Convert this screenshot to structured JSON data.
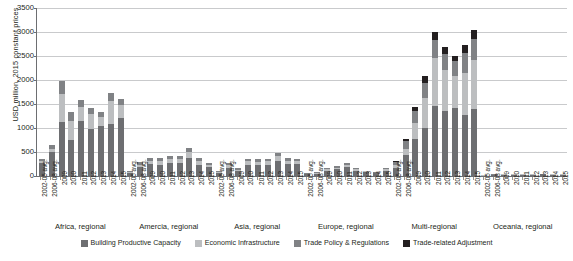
{
  "chart_data": {
    "type": "bar",
    "stacked": true,
    "title": "",
    "xlabel": "",
    "ylabel": "USD million, 2015 constant prices",
    "ylim": [
      0,
      3500
    ],
    "ytick_step": 500,
    "yticks": [
      "0",
      "500",
      "1000",
      "1500",
      "2000",
      "2500",
      "3000",
      "3500"
    ],
    "grid": "horizontal",
    "legend_position": "bottom",
    "categories": [
      "2002-05 avg.",
      "2006-08 avg.",
      "2009",
      "2010",
      "2011",
      "2012",
      "2013",
      "2014",
      "2015"
    ],
    "series": [
      {
        "name": "Building Productive Capacity",
        "color": "#6d6e71"
      },
      {
        "name": "Economic Infrastructure",
        "color": "#bcbec0"
      },
      {
        "name": "Trade Policy & Regulations",
        "color": "#808285"
      },
      {
        "name": "Trade-related Adjustment",
        "color": "#231f20"
      }
    ],
    "groups": [
      {
        "name": "Africa, regional",
        "bars": [
          {
            "category": "2002-05 avg.",
            "values": [
              275,
              40,
              40,
              0
            ],
            "total": 355
          },
          {
            "category": "2006-08 avg.",
            "values": [
              500,
              55,
              85,
              0
            ],
            "total": 640
          },
          {
            "category": "2009",
            "values": [
              1130,
              570,
              290,
              0
            ],
            "total": 1990
          },
          {
            "category": "2010",
            "values": [
              750,
              400,
              175,
              0
            ],
            "total": 1325
          },
          {
            "category": "2011",
            "values": [
              1140,
              295,
              155,
              0
            ],
            "total": 1590
          },
          {
            "category": "2012",
            "values": [
              980,
              305,
              140,
              0
            ],
            "total": 1425
          },
          {
            "category": "2013",
            "values": [
              1035,
              190,
              115,
              0
            ],
            "total": 1340
          },
          {
            "category": "2014",
            "values": [
              1085,
              470,
              175,
              0
            ],
            "total": 1730
          },
          {
            "category": "2015",
            "values": [
              1200,
              290,
              125,
              0
            ],
            "total": 1615
          }
        ]
      },
      {
        "name": "Amercia, regional",
        "bars": [
          {
            "category": "2002-05 avg.",
            "values": [
              60,
              15,
              25,
              0
            ],
            "total": 100
          },
          {
            "category": "2006-08 avg.",
            "values": [
              195,
              40,
              50,
              0
            ],
            "total": 285
          },
          {
            "category": "2009",
            "values": [
              250,
              60,
              70,
              0
            ],
            "total": 380
          },
          {
            "category": "2010",
            "values": [
              235,
              75,
              70,
              0
            ],
            "total": 380
          },
          {
            "category": "2011",
            "values": [
              270,
              75,
              70,
              0
            ],
            "total": 415
          },
          {
            "category": "2012",
            "values": [
              275,
              80,
              65,
              0
            ],
            "total": 420
          },
          {
            "category": "2013",
            "values": [
              380,
              120,
              85,
              0
            ],
            "total": 585
          },
          {
            "category": "2014",
            "values": [
              240,
              70,
              60,
              0
            ],
            "total": 370
          },
          {
            "category": "2015",
            "values": [
              180,
              50,
              45,
              0
            ],
            "total": 275
          }
        ]
      },
      {
        "name": "Asia, regional",
        "bars": [
          {
            "category": "2002-05 avg.",
            "values": [
              65,
              15,
              20,
              0
            ],
            "total": 100
          },
          {
            "category": "2006-08 avg.",
            "values": [
              175,
              45,
              45,
              0
            ],
            "total": 265
          },
          {
            "category": "2009",
            "values": [
              105,
              30,
              30,
              0
            ],
            "total": 165
          },
          {
            "category": "2010",
            "values": [
              235,
              70,
              60,
              0
            ],
            "total": 365
          },
          {
            "category": "2011",
            "values": [
              230,
              65,
              60,
              0
            ],
            "total": 355
          },
          {
            "category": "2012",
            "values": [
              235,
              70,
              55,
              0
            ],
            "total": 360
          },
          {
            "category": "2013",
            "values": [
              320,
              95,
              75,
              0
            ],
            "total": 490
          },
          {
            "category": "2014",
            "values": [
              250,
              70,
              55,
              0
            ],
            "total": 375
          },
          {
            "category": "2015",
            "values": [
              245,
              65,
              55,
              0
            ],
            "total": 365
          }
        ]
      },
      {
        "name": "Europe, regional",
        "bars": [
          {
            "category": "2002-05 avg.",
            "values": [
              35,
              10,
              15,
              0
            ],
            "total": 60
          },
          {
            "category": "2006-08 avg.",
            "values": [
              45,
              15,
              15,
              0
            ],
            "total": 75
          },
          {
            "category": "2009",
            "values": [
              110,
              30,
              30,
              0
            ],
            "total": 170
          },
          {
            "category": "2010",
            "values": [
              140,
              35,
              35,
              0
            ],
            "total": 210
          },
          {
            "category": "2011",
            "values": [
              185,
              45,
              40,
              0
            ],
            "total": 270
          },
          {
            "category": "2012",
            "values": [
              115,
              30,
              30,
              0
            ],
            "total": 175
          },
          {
            "category": "2013",
            "values": [
              75,
              20,
              20,
              0
            ],
            "total": 115
          },
          {
            "category": "2014",
            "values": [
              55,
              15,
              15,
              0
            ],
            "total": 85
          },
          {
            "category": "2015",
            "values": [
              110,
              30,
              25,
              0
            ],
            "total": 165
          }
        ]
      },
      {
        "name": "Multi-regional",
        "bars": [
          {
            "category": "2002-05 avg.",
            "values": [
              170,
              50,
              75,
              20
            ],
            "total": 315
          },
          {
            "category": "2006-08 avg.",
            "values": [
              430,
              140,
              160,
              45
            ],
            "total": 775
          },
          {
            "category": "2009",
            "values": [
              780,
              320,
              260,
              85
            ],
            "total": 1445
          },
          {
            "category": "2010",
            "values": [
              1010,
              620,
              310,
              140
            ],
            "total": 2080
          },
          {
            "category": "2011",
            "values": [
              1460,
              990,
              390,
              160
            ],
            "total": 3000
          },
          {
            "category": "2012",
            "values": [
              1350,
              860,
              330,
              140
            ],
            "total": 2680
          },
          {
            "category": "2013",
            "values": [
              1420,
              670,
              300,
              105
            ],
            "total": 2495
          },
          {
            "category": "2014",
            "values": [
              1270,
              870,
              420,
              160
            ],
            "total": 2720
          },
          {
            "category": "2015",
            "values": [
              1400,
              1020,
              440,
              185
            ],
            "total": 3045
          }
        ]
      },
      {
        "name": "Oceania, regional",
        "bars": [
          {
            "category": "2002-05 avg.",
            "values": [
              10,
              3,
              4,
              0
            ],
            "total": 17
          },
          {
            "category": "2006-08 avg.",
            "values": [
              22,
              6,
              7,
              0
            ],
            "total": 35
          },
          {
            "category": "2009",
            "values": [
              28,
              8,
              9,
              0
            ],
            "total": 45
          },
          {
            "category": "2010",
            "values": [
              25,
              7,
              8,
              0
            ],
            "total": 40
          },
          {
            "category": "2011",
            "values": [
              30,
              8,
              9,
              0
            ],
            "total": 47
          },
          {
            "category": "2012",
            "values": [
              27,
              8,
              8,
              0
            ],
            "total": 43
          },
          {
            "category": "2013",
            "values": [
              32,
              9,
              10,
              0
            ],
            "total": 51
          },
          {
            "category": "2014",
            "values": [
              30,
              9,
              9,
              0
            ],
            "total": 48
          },
          {
            "category": "2015",
            "values": [
              28,
              8,
              9,
              0
            ],
            "total": 45
          }
        ]
      }
    ]
  }
}
